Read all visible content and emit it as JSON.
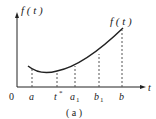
{
  "figure": {
    "caption": "( a )",
    "y_axis_label": "f ( t )",
    "curve_label": "f ( t )",
    "x_axis_label": "t",
    "origin_label": "0",
    "colors": {
      "stroke": "#222222",
      "dash": "#555555",
      "background": "#ffffff"
    }
  },
  "x_ticks": [
    {
      "label": "a",
      "sub": ""
    },
    {
      "label": "t",
      "sub": "*"
    },
    {
      "label": "a",
      "sub": "1"
    },
    {
      "label": "b",
      "sub": "1"
    },
    {
      "label": "b",
      "sub": ""
    }
  ]
}
